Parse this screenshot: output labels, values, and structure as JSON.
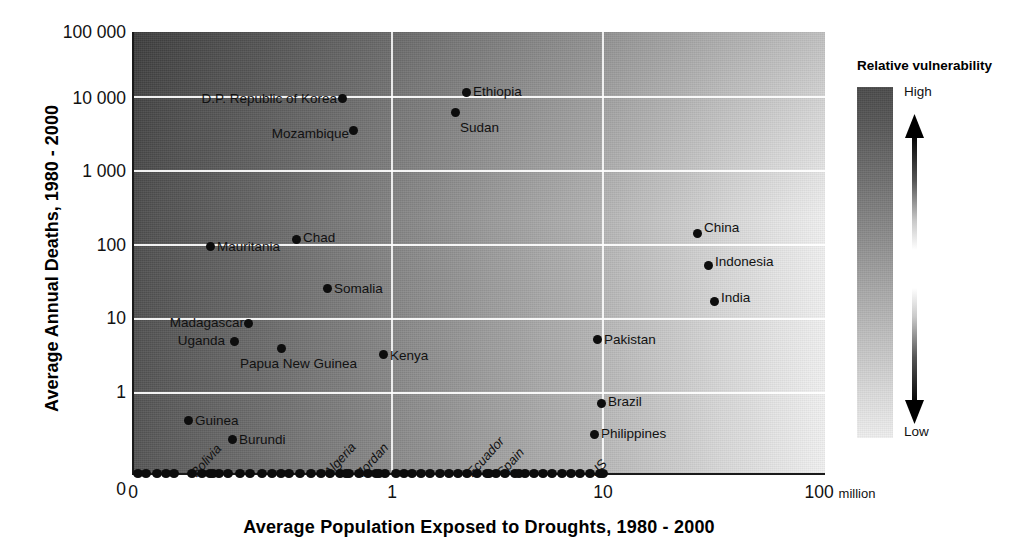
{
  "chart_data": {
    "type": "scatter",
    "title": "",
    "xlabel": "Average Population Exposed to Droughts, 1980 - 2000",
    "ylabel": "Average Annual Deaths, 1980 - 2000",
    "x_ticks": [
      "0",
      "1",
      "10",
      "100"
    ],
    "x_unit": "million",
    "y_ticks": [
      "0",
      "1",
      "10",
      "100",
      "1 000",
      "10 000",
      "100 000"
    ],
    "x_scale": "log (with 0 anchor at left)",
    "y_scale": "log (with 0 anchor at baseline)",
    "grid": true,
    "legend": {
      "title": "Relative vulnerability",
      "high_label": "High",
      "low_label": "Low",
      "position": "right",
      "gradient_high_color": "#4a4a4a",
      "gradient_low_color": "#efefef"
    },
    "background_encoding": {
      "description": "Greyscale field: dark (high relative vulnerability) at left, light (low) at right",
      "dark_color": "#4d4d4d",
      "light_color": "#f0f0f0"
    },
    "labeled_points": [
      {
        "name": "D.P. Republic of Korea",
        "x_million": 0.72,
        "y_deaths": 12000,
        "label_side": "left"
      },
      {
        "name": "Ethiopia",
        "x_million": 2.6,
        "y_deaths": 15000,
        "label_side": "right"
      },
      {
        "name": "Sudan",
        "x_million": 2.3,
        "y_deaths": 6500,
        "label_side": "below-right"
      },
      {
        "name": "Mozambique",
        "x_million": 0.79,
        "y_deaths": 4300,
        "label_side": "left"
      },
      {
        "name": "China",
        "x_million": 27,
        "y_deaths": 165,
        "label_side": "right"
      },
      {
        "name": "Chad",
        "x_million": 0.68,
        "y_deaths": 135,
        "label_side": "right"
      },
      {
        "name": "Mauritania",
        "x_million": 0.19,
        "y_deaths": 100,
        "label_side": "right"
      },
      {
        "name": "Indonesia",
        "x_million": 30,
        "y_deaths": 60,
        "label_side": "right"
      },
      {
        "name": "Somalia",
        "x_million": 0.76,
        "y_deaths": 28,
        "label_side": "right"
      },
      {
        "name": "India",
        "x_million": 33,
        "y_deaths": 20,
        "label_side": "right"
      },
      {
        "name": "Madagascar",
        "x_million": 0.33,
        "y_deaths": 9,
        "label_side": "left"
      },
      {
        "name": "Pakistan",
        "x_million": 9.5,
        "y_deaths": 6.5,
        "label_side": "right"
      },
      {
        "name": "Uganda",
        "x_million": 0.25,
        "y_deaths": 5,
        "label_side": "left"
      },
      {
        "name": "Papua New Guinea",
        "x_million": 0.42,
        "y_deaths": 4.3,
        "label_side": "below-left"
      },
      {
        "name": "Kenya",
        "x_million": 1.2,
        "y_deaths": 3.8,
        "label_side": "right"
      },
      {
        "name": "Brazil",
        "x_million": 10,
        "y_deaths": 1.0,
        "label_side": "right"
      },
      {
        "name": "Guinea",
        "x_million": 0.17,
        "y_deaths": 0.58,
        "label_side": "right"
      },
      {
        "name": "Philippines",
        "x_million": 9.3,
        "y_deaths": 0.45,
        "label_side": "right"
      },
      {
        "name": "Burundi",
        "x_million": 0.3,
        "y_deaths": 0.4,
        "label_side": "right"
      },
      {
        "name": "Bolivia",
        "x_million": 0.21,
        "y_deaths": 0,
        "label_side": "rotated"
      },
      {
        "name": "Algeria",
        "x_million": 0.86,
        "y_deaths": 0,
        "label_side": "rotated"
      },
      {
        "name": "Jordan",
        "x_million": 1.0,
        "y_deaths": 0,
        "label_side": "rotated"
      },
      {
        "name": "Ecuador",
        "x_million": 1.9,
        "y_deaths": 0,
        "label_side": "rotated"
      },
      {
        "name": "Spain",
        "x_million": 2.2,
        "y_deaths": 0,
        "label_side": "rotated"
      },
      {
        "name": "US",
        "x_million": 10,
        "y_deaths": 0,
        "label_side": "rotated"
      }
    ],
    "unlabeled_baseline_points_x_px": [
      138,
      146,
      157,
      166,
      174,
      192,
      202,
      210,
      219,
      228,
      240,
      250,
      262,
      272,
      281,
      289,
      300,
      311,
      321,
      330,
      340,
      349,
      359,
      368,
      376,
      385,
      396,
      404,
      412,
      421,
      430,
      440,
      449,
      458,
      467,
      477,
      487,
      496,
      505,
      515,
      525,
      534,
      543,
      552,
      562,
      571,
      580,
      590,
      600
    ]
  },
  "axes": {
    "y_label": "Average Annual Deaths, 1980 - 2000",
    "x_label": "Average Population Exposed to Droughts, 1980 - 2000",
    "x_tick_0": "0",
    "x_tick_1": "1",
    "x_tick_10": "10",
    "x_tick_100": "100",
    "x_tick_unit": "million",
    "y_tick_0": "0",
    "y_tick_1": "1",
    "y_tick_10": "10",
    "y_tick_100": "100",
    "y_tick_1000": "1 000",
    "y_tick_10000": "10 000",
    "y_tick_100000": "100 000"
  },
  "legend": {
    "title": "Relative vulnerability",
    "high": "High",
    "low": "Low"
  }
}
